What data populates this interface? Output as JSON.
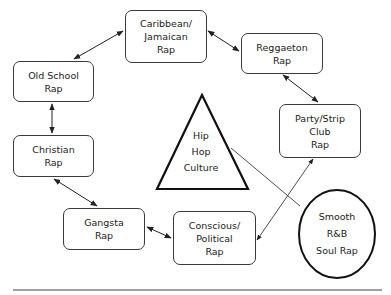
{
  "diagram": {
    "center": {
      "shape": "triangle",
      "lines": [
        "Hip",
        "Hop",
        "Culture"
      ]
    },
    "outlier": {
      "shape": "ellipse",
      "lines": [
        "Smooth",
        "R&B",
        "Soul Rap"
      ]
    },
    "nodes": [
      {
        "id": "caribbean",
        "lines": [
          "Caribbean/",
          "Jamaican",
          "Rap"
        ]
      },
      {
        "id": "reggaeton",
        "lines": [
          "Reggaeton",
          "Rap"
        ]
      },
      {
        "id": "party",
        "lines": [
          "Party/Strip",
          "Club",
          "Rap"
        ]
      },
      {
        "id": "conscious",
        "lines": [
          "Conscious/",
          "Political",
          "Rap"
        ]
      },
      {
        "id": "gangsta",
        "lines": [
          "Gangsta",
          "Rap"
        ]
      },
      {
        "id": "christian",
        "lines": [
          "Christian",
          "Rap"
        ]
      },
      {
        "id": "oldschool",
        "lines": [
          "Old School",
          "Rap"
        ]
      }
    ],
    "edges": [
      {
        "from": "oldschool",
        "to": "caribbean",
        "type": "bidirectional"
      },
      {
        "from": "caribbean",
        "to": "reggaeton",
        "type": "bidirectional"
      },
      {
        "from": "reggaeton",
        "to": "party",
        "type": "bidirectional"
      },
      {
        "from": "party",
        "to": "conscious",
        "type": "bidirectional"
      },
      {
        "from": "conscious",
        "to": "gangsta",
        "type": "bidirectional"
      },
      {
        "from": "gangsta",
        "to": "christian",
        "type": "bidirectional"
      },
      {
        "from": "christian",
        "to": "oldschool",
        "type": "bidirectional"
      },
      {
        "from": "center",
        "to": "outlier",
        "type": "line"
      }
    ],
    "colors": {
      "stroke": "#222222",
      "background": "#ffffff"
    }
  }
}
